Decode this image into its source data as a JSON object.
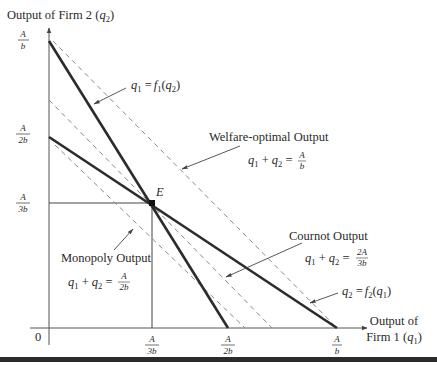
{
  "diagram": {
    "type": "cournot-duopoly-reaction-curves",
    "y_axis": {
      "label": "Output of Firm 2",
      "variable": "q",
      "variable_sub": "2",
      "ticks": [
        {
          "num": "A",
          "den": "b",
          "value": "A/b"
        },
        {
          "num": "A",
          "den": "2b",
          "value": "A/2b"
        },
        {
          "num": "A",
          "den": "3b",
          "value": "A/3b"
        }
      ]
    },
    "x_axis": {
      "label_line1": "Output of",
      "label_line2": "Firm 1",
      "variable": "q",
      "variable_sub": "1",
      "origin": "0",
      "ticks": [
        {
          "num": "A",
          "den": "3b",
          "value": "A/3b"
        },
        {
          "num": "A",
          "den": "2b",
          "value": "A/2b"
        },
        {
          "num": "A",
          "den": "b",
          "value": "A/b"
        }
      ]
    },
    "equilibrium": {
      "label": "E",
      "q1": "A/3b",
      "q2": "A/3b"
    },
    "reaction_curves": [
      {
        "name": "f1",
        "label": "q₁ = f₁(q₂)",
        "from": [
          "0",
          "A/b"
        ],
        "to": [
          "A/2b",
          "0"
        ]
      },
      {
        "name": "f2",
        "label": "q₂ = f₂(q₁)",
        "from": [
          "0",
          "A/2b"
        ],
        "to": [
          "A/b",
          "0"
        ]
      }
    ],
    "iso_output_lines": [
      {
        "name": "welfare",
        "title": "Welfare-optimal Output",
        "eq_lhs": "q₁ + q₂ =",
        "num": "A",
        "den": "b"
      },
      {
        "name": "cournot",
        "title": "Cournot Output",
        "eq_lhs": "q₁ + q₂ =",
        "num": "2A",
        "den": "3b"
      },
      {
        "name": "monopoly",
        "title": "Monopoly Output",
        "eq_lhs": "q₁ + q₂ =",
        "num": "A",
        "den": "2b"
      }
    ],
    "labels": {
      "f1": {
        "lhs": "q",
        "lhs_sub": "1",
        "eq": " =",
        "fn": "f",
        "fn_sub": "1",
        "arg": "q",
        "arg_sub": "2"
      },
      "f2": {
        "lhs": "q",
        "lhs_sub": "2",
        "eq": " =",
        "fn": "f",
        "fn_sub": "2",
        "arg": "q",
        "arg_sub": "1"
      }
    }
  }
}
